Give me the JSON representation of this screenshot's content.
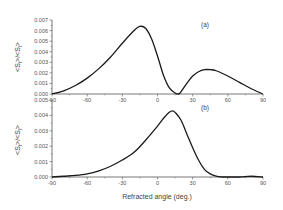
{
  "chart_data": [
    {
      "type": "line",
      "panel_label": "(a)",
      "title": "",
      "xlabel": "",
      "ylabel": "<S_t>/<S_i>",
      "xlim": [
        -90,
        90
      ],
      "ylim": [
        0,
        0.007
      ],
      "x_ticks": [
        "-90",
        "-60",
        "-30",
        "0",
        "30",
        "60",
        "90"
      ],
      "y_ticks": [
        "0.000",
        "0.001",
        "0.002",
        "0.003",
        "0.004",
        "0.005",
        "0.006",
        "0.007"
      ],
      "grid": false,
      "legend": null,
      "series": [
        {
          "name": "(a)",
          "x": [
            -90,
            -80,
            -70,
            -60,
            -50,
            -40,
            -30,
            -20,
            -15,
            -10,
            -5,
            0,
            5,
            10,
            15,
            18,
            20,
            25,
            30,
            35,
            40,
            45,
            50,
            60,
            70,
            80,
            90
          ],
          "y": [
            0.0,
            0.0003,
            0.0008,
            0.0015,
            0.0024,
            0.0035,
            0.0048,
            0.006,
            0.0064,
            0.0062,
            0.0052,
            0.0036,
            0.0018,
            0.0006,
            0.0001,
            0.0,
            0.0002,
            0.001,
            0.0017,
            0.0021,
            0.0023,
            0.0023,
            0.0022,
            0.0017,
            0.0011,
            0.0005,
            0.0
          ]
        }
      ]
    },
    {
      "type": "line",
      "panel_label": "(b)",
      "title": "",
      "xlabel": "Refracted angle (deg.)",
      "ylabel": "<S_t>/<S_i>",
      "xlim": [
        -90,
        90
      ],
      "ylim": [
        0,
        0.005
      ],
      "x_ticks": [
        "-90",
        "-60",
        "-30",
        "0",
        "30",
        "60",
        "90"
      ],
      "y_ticks": [
        "0.000",
        "0.001",
        "0.002",
        "0.003",
        "0.004",
        "0.005"
      ],
      "grid": false,
      "legend": null,
      "series": [
        {
          "name": "(b)",
          "x": [
            -90,
            -80,
            -70,
            -60,
            -50,
            -40,
            -30,
            -20,
            -10,
            0,
            5,
            10,
            13,
            15,
            20,
            25,
            30,
            35,
            40,
            45,
            50,
            55,
            60,
            70,
            80,
            90
          ],
          "y": [
            0.0,
            5e-05,
            0.0001,
            0.0002,
            0.0004,
            0.0007,
            0.0011,
            0.0016,
            0.0024,
            0.0033,
            0.0038,
            0.0042,
            0.0043,
            0.0042,
            0.0037,
            0.0028,
            0.0019,
            0.0011,
            0.0005,
            0.0002,
            5e-05,
            0.0,
            0.0,
            0.0,
            5e-05,
            0.0
          ]
        }
      ]
    }
  ],
  "labels": {
    "panel_a": "(a)",
    "panel_b": "(b)",
    "ylabel_top": "<S",
    "ylabel_sub_t": "t",
    "ylabel_mid": ">/<S",
    "ylabel_sub_i": "i",
    "ylabel_end": ">",
    "xlabel": "Refracted angle (deg.)"
  },
  "colors": {
    "line": "#1a1a1a",
    "axis": "#555555",
    "text": "#555555"
  }
}
